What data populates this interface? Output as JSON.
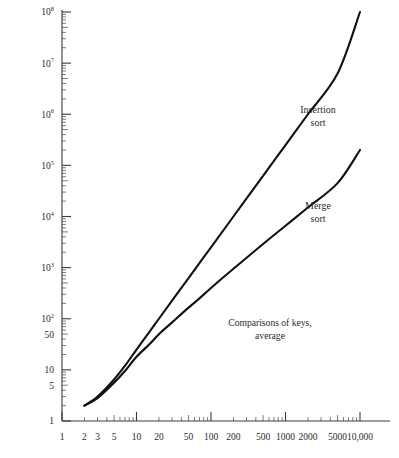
{
  "chart_data": {
    "type": "line",
    "title": "",
    "subtitle": "",
    "xlabel": "",
    "ylabel": "",
    "xscale": "log",
    "yscale": "log",
    "xlim": [
      1,
      10000
    ],
    "ylim": [
      1,
      100000000
    ],
    "grid": false,
    "legend_position": "inline-annotation",
    "annotations": [
      {
        "id": "note",
        "line1": "Comparisons of keys,",
        "line2": "average"
      }
    ],
    "xticks": [
      {
        "value": 1,
        "label": "1"
      },
      {
        "value": 2,
        "label": "2"
      },
      {
        "value": 3,
        "label": "3"
      },
      {
        "value": 5,
        "label": "5"
      },
      {
        "value": 10,
        "label": "10"
      },
      {
        "value": 20,
        "label": "20"
      },
      {
        "value": 50,
        "label": "50"
      },
      {
        "value": 100,
        "label": "100"
      },
      {
        "value": 200,
        "label": "200"
      },
      {
        "value": 500,
        "label": "500"
      },
      {
        "value": 1000,
        "label": "1000"
      },
      {
        "value": 2000,
        "label": "2000"
      },
      {
        "value": 5000,
        "label": "5000"
      },
      {
        "value": 10000,
        "label": "10,000"
      }
    ],
    "yticks": [
      {
        "value": 1,
        "label": "1",
        "base": "1",
        "exp": ""
      },
      {
        "value": 5,
        "label": "5",
        "base": "5",
        "exp": ""
      },
      {
        "value": 10,
        "label": "10",
        "base": "10",
        "exp": ""
      },
      {
        "value": 50,
        "label": "50",
        "base": "50",
        "exp": ""
      },
      {
        "value": 100,
        "label": "10^2",
        "base": "10",
        "exp": "2"
      },
      {
        "value": 1000,
        "label": "10^3",
        "base": "10",
        "exp": "3"
      },
      {
        "value": 10000,
        "label": "10^4",
        "base": "10",
        "exp": "4"
      },
      {
        "value": 100000,
        "label": "10^5",
        "base": "10",
        "exp": "5"
      },
      {
        "value": 1000000,
        "label": "10^6",
        "base": "10",
        "exp": "6"
      },
      {
        "value": 10000000,
        "label": "10^7",
        "base": "10",
        "exp": "7"
      },
      {
        "value": 100000000,
        "label": "10^8",
        "base": "10",
        "exp": "8"
      }
    ],
    "series": [
      {
        "name": "Insertion sort",
        "label_line1": "Insertion",
        "label_line2": "sort",
        "color": "#111111",
        "points": [
          {
            "x": 2,
            "y": 2
          },
          {
            "x": 3,
            "y": 3
          },
          {
            "x": 5,
            "y": 6.5
          },
          {
            "x": 7,
            "y": 12
          },
          {
            "x": 10,
            "y": 25
          },
          {
            "x": 15,
            "y": 56
          },
          {
            "x": 20,
            "y": 100
          },
          {
            "x": 30,
            "y": 225
          },
          {
            "x": 50,
            "y": 625
          },
          {
            "x": 70,
            "y": 1225
          },
          {
            "x": 100,
            "y": 2500
          },
          {
            "x": 200,
            "y": 10000
          },
          {
            "x": 500,
            "y": 62500
          },
          {
            "x": 1000,
            "y": 250000
          },
          {
            "x": 2000,
            "y": 1000000
          },
          {
            "x": 5000,
            "y": 6250000
          },
          {
            "x": 10000,
            "y": 100000000
          }
        ]
      },
      {
        "name": "Merge sort",
        "label_line1": "Merge",
        "label_line2": "sort",
        "color": "#111111",
        "points": [
          {
            "x": 2,
            "y": 2
          },
          {
            "x": 3,
            "y": 2.8
          },
          {
            "x": 5,
            "y": 5.6
          },
          {
            "x": 7,
            "y": 9.5
          },
          {
            "x": 10,
            "y": 18
          },
          {
            "x": 15,
            "y": 32
          },
          {
            "x": 20,
            "y": 50
          },
          {
            "x": 30,
            "y": 85
          },
          {
            "x": 50,
            "y": 165
          },
          {
            "x": 70,
            "y": 250
          },
          {
            "x": 100,
            "y": 400
          },
          {
            "x": 200,
            "y": 950
          },
          {
            "x": 500,
            "y": 2900
          },
          {
            "x": 1000,
            "y": 6600
          },
          {
            "x": 2000,
            "y": 15000
          },
          {
            "x": 5000,
            "y": 45000
          },
          {
            "x": 10000,
            "y": 200000
          }
        ]
      }
    ]
  }
}
